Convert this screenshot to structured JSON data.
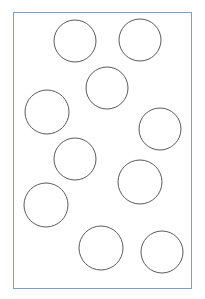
{
  "diagram": {
    "frame": {
      "x": 13,
      "y": 12,
      "width": 179,
      "height": 277,
      "border_color": "#7b9dd2"
    },
    "circle_stroke": "#5a5a5a",
    "circles": [
      {
        "cx": 75,
        "cy": 41,
        "r": 21
      },
      {
        "cx": 140,
        "cy": 40,
        "r": 21
      },
      {
        "cx": 107,
        "cy": 88,
        "r": 21
      },
      {
        "cx": 47,
        "cy": 112,
        "r": 22
      },
      {
        "cx": 160,
        "cy": 129,
        "r": 21
      },
      {
        "cx": 75,
        "cy": 159,
        "r": 21
      },
      {
        "cx": 140,
        "cy": 182,
        "r": 22
      },
      {
        "cx": 46,
        "cy": 205,
        "r": 22
      },
      {
        "cx": 101,
        "cy": 248,
        "r": 22
      },
      {
        "cx": 162,
        "cy": 252,
        "r": 21
      }
    ],
    "circle_count": 10
  }
}
